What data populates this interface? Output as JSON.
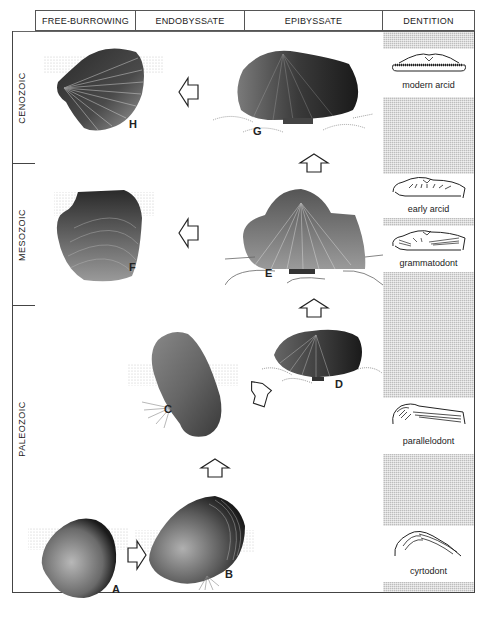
{
  "header": {
    "columns": [
      {
        "label": "FREE-BURROWING"
      },
      {
        "label": "ENDOBYSSATE"
      },
      {
        "label": "EPIBYSSATE"
      },
      {
        "label": "DENTITION"
      }
    ]
  },
  "eras": [
    {
      "label": "CENOZOIC"
    },
    {
      "label": "MESOZOIC"
    },
    {
      "label": "PALEOZOIC"
    }
  ],
  "dentition": [
    {
      "label": "modern arcid"
    },
    {
      "label": "early arcid"
    },
    {
      "label": "grammatodont"
    },
    {
      "label": "parallelodont"
    },
    {
      "label": "cyrtodont"
    }
  ],
  "specimens": [
    {
      "id": "A",
      "mode": "free-burrowing",
      "era": "Paleozoic"
    },
    {
      "id": "B",
      "mode": "endobyssate",
      "era": "Paleozoic"
    },
    {
      "id": "C",
      "mode": "endobyssate",
      "era": "Paleozoic"
    },
    {
      "id": "D",
      "mode": "epibyssate",
      "era": "Paleozoic"
    },
    {
      "id": "E",
      "mode": "epibyssate",
      "era": "Mesozoic"
    },
    {
      "id": "F",
      "mode": "free-burrowing",
      "era": "Mesozoic"
    },
    {
      "id": "G",
      "mode": "epibyssate",
      "era": "Cenozoic"
    },
    {
      "id": "H",
      "mode": "free-burrowing",
      "era": "Cenozoic"
    }
  ],
  "colors": {
    "line": "#444444",
    "hatch": "#bdbdbd",
    "shell_dark": "#2a2a2a",
    "shell_light": "#9a9a9a"
  }
}
